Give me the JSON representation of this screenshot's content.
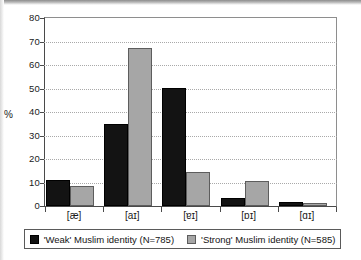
{
  "chart_data": {
    "type": "bar",
    "title": "",
    "subtitle": "",
    "xlabel": "",
    "ylabel": "%",
    "ylim": [
      0,
      80
    ],
    "yticks": [
      0,
      10,
      20,
      30,
      40,
      50,
      60,
      70,
      80
    ],
    "ytick_labels": [
      "0",
      "10",
      "20",
      "30",
      "40",
      "50",
      "60",
      "70",
      "80"
    ],
    "grid": "horizontal-dotted",
    "legend_position": "bottom",
    "categories": [
      "[æ]",
      "[aɪ]",
      "[ɐɪ]",
      "[ɒɪ]",
      "[ɑɪ]"
    ],
    "series": [
      {
        "name": "'Weak' Muslim identity (N=785)",
        "color": "#131313",
        "values": [
          11.0,
          35.0,
          50.2,
          3.5,
          1.6
        ]
      },
      {
        "name": "'Strong' Muslim identity (N=585)",
        "color": "#a6a6a6",
        "values": [
          8.4,
          67.2,
          14.4,
          10.5,
          1.4
        ]
      }
    ]
  },
  "legend": {
    "entries": [
      {
        "label": "'Weak' Muslim identity (N=785)",
        "swatch": "black-square"
      },
      {
        "label": "'Strong' Muslim identity (N=585)",
        "swatch": "gray-square"
      }
    ]
  },
  "axis": {
    "y_title": "%"
  }
}
